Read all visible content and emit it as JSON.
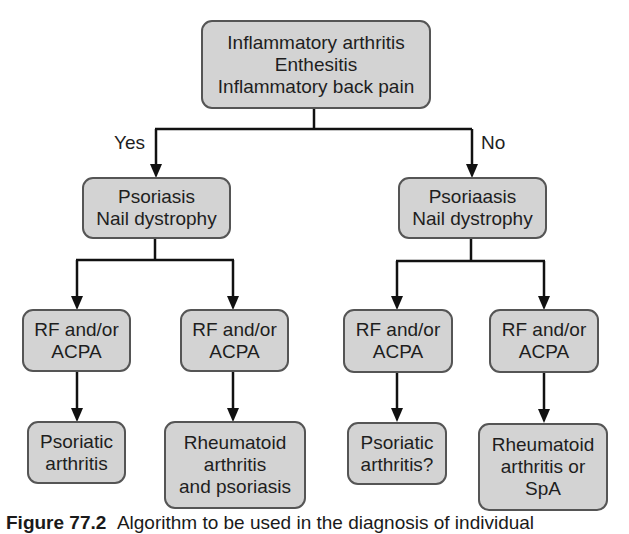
{
  "diagram": {
    "type": "flowchart",
    "root": {
      "lines": [
        "Inflammatory arthritis",
        "Enthesitis",
        "Inflammatory back pain"
      ]
    },
    "branches": {
      "yes_label": "Yes",
      "no_label": "No"
    },
    "level2": [
      {
        "id": "yes",
        "lines": [
          "Psoriasis",
          "Nail dystrophy"
        ]
      },
      {
        "id": "no",
        "lines": [
          "Psoriaasis",
          "Nail dystrophy"
        ]
      }
    ],
    "level3": [
      {
        "lines": [
          "RF and/or",
          "ACPA"
        ]
      },
      {
        "lines": [
          "RF and/or",
          "ACPA"
        ]
      },
      {
        "lines": [
          "RF and/or",
          "ACPA"
        ]
      },
      {
        "lines": [
          "RF and/or",
          "ACPA"
        ]
      }
    ],
    "level4": [
      {
        "lines": [
          "Psoriatic",
          "arthritis"
        ]
      },
      {
        "lines": [
          "Rheumatoid",
          "arthritis",
          "and psoriasis"
        ]
      },
      {
        "lines": [
          "Psoriatic",
          "arthritis?"
        ]
      },
      {
        "lines": [
          "Rheumatoid",
          "arthritis or",
          "SpA"
        ]
      }
    ],
    "colors": {
      "node_fill": "#d3d3d3",
      "node_border": "#555555",
      "connector": "#111111"
    }
  },
  "caption": {
    "figure_label": "Figure 77.2",
    "text": "Algorithm to be used in the diagnosis of individual"
  }
}
